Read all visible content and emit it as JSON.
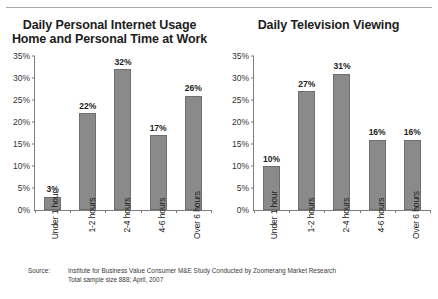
{
  "chart_data": [
    {
      "type": "bar",
      "title_lines": [
        "Daily Personal Internet Usage",
        "Home and Personal Time at Work"
      ],
      "title": "Daily Personal Internet Usage Home and Personal Time at Work",
      "categories": [
        "Under 1 hour",
        "1-2 hours",
        "2-4 hours",
        "4-6 hours",
        "Over 6 hours"
      ],
      "values": [
        3,
        22,
        32,
        17,
        26
      ],
      "value_labels": [
        "3%",
        "22%",
        "32%",
        "17%",
        "26%"
      ],
      "ylim": [
        0,
        35
      ],
      "ytick_values": [
        0,
        5,
        10,
        15,
        20,
        25,
        30,
        35
      ],
      "ytick_labels": [
        "0%",
        "5%",
        "10%",
        "15%",
        "20%",
        "25%",
        "30%",
        "35%"
      ],
      "xlabel": "",
      "ylabel": "",
      "grid": false,
      "legend": false,
      "bar_color": "#8a8a8a"
    },
    {
      "type": "bar",
      "title_lines": [
        "Daily Television Viewing"
      ],
      "title": "Daily Television Viewing",
      "categories": [
        "Under 1 hour",
        "1-2 hours",
        "2-4 hours",
        "4-6 hours",
        "Over 6 hours"
      ],
      "values": [
        10,
        27,
        31,
        16,
        16
      ],
      "value_labels": [
        "10%",
        "27%",
        "31%",
        "16%",
        "16%"
      ],
      "ylim": [
        0,
        35
      ],
      "ytick_values": [
        0,
        5,
        10,
        15,
        20,
        25,
        30,
        35
      ],
      "ytick_labels": [
        "0%",
        "5%",
        "10%",
        "15%",
        "20%",
        "25%",
        "30%",
        "35%"
      ],
      "xlabel": "",
      "ylabel": "",
      "grid": false,
      "legend": false,
      "bar_color": "#8a8a8a"
    }
  ],
  "footnote": {
    "label": "Source:",
    "line1": "Institute for Business Value Consumer M&E Study Conducted by Zoomerang Market Research",
    "line2": "Total sample size 888; April, 2007"
  }
}
